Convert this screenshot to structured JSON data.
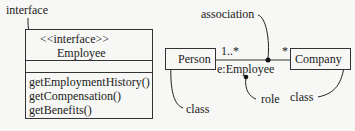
{
  "interface_note": {
    "label": "interface"
  },
  "interface_box": {
    "stereotype": "<<interface>>",
    "name": "Employee",
    "attributes": [],
    "operations": [
      "getEmploymentHistory()",
      "getCompensation()",
      "getBenefits()"
    ]
  },
  "association_diagram": {
    "classes": [
      {
        "name": "Person"
      },
      {
        "name": "Company"
      }
    ],
    "association_label": "association",
    "multiplicity_left": "1..*",
    "multiplicity_right": "*",
    "role_name": "e:Employee",
    "annotations": {
      "role": "role",
      "class_left": "class",
      "class_right": "class"
    }
  }
}
